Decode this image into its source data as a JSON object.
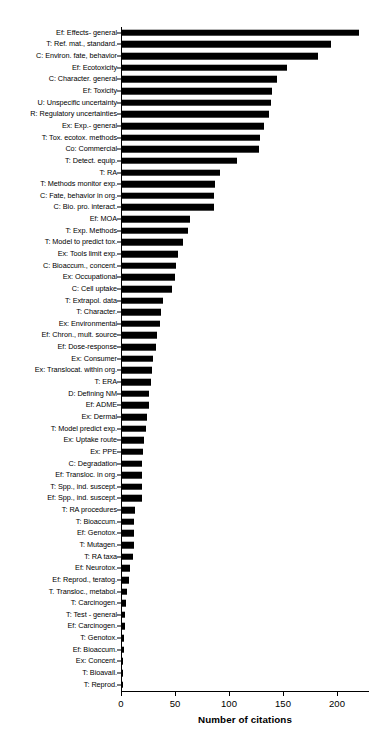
{
  "chart_data": {
    "type": "bar",
    "orientation": "horizontal",
    "title": "",
    "xlabel": "Number of citations",
    "ylabel": "",
    "xlim": [
      0,
      230
    ],
    "xticks": [
      0,
      50,
      100,
      150,
      200
    ],
    "xtick_labels": [
      "0",
      "50",
      "100",
      "150",
      "200"
    ],
    "grid": false,
    "legend": null,
    "bar_color": "#000000",
    "categories": [
      "Ef: Effects- general",
      "T: Ref. mat., standard.",
      "C: Environ. fate, behavior",
      "Ef: Ecotoxicity",
      "C: Character. general",
      "Ef: Toxicity",
      "U: Unspecific uncertainty",
      "R: Regulatory uncertainties",
      "Ex: Exp.- general",
      "T: Tox. ecotox. methods",
      "Co: Commercial",
      "T: Detect. equip.",
      "T: RA",
      "T: Methods monitor exp.",
      "C: Fate, behavior in org.",
      "C: Bio. pro. interact.",
      "Ef: MOA",
      "T: Exp. Methods",
      "T: Model to predict tox.",
      "Ex: Tools limit exp.",
      "C: Bioaccum., concent.",
      "Ex: Occupational",
      "C: Cell uptake",
      "T: Extrapol. data",
      "T: Character.",
      "Ex: Environmental",
      "Ef: Chron., mult. source",
      "Ef: Dose-response",
      "Ex: Consumer",
      "Ex: Translocat. within org.",
      "T: ERA",
      "D: Defining NM",
      "Ef: ADME",
      "Ex: Dermal",
      "T: Model predict exp.",
      "Ex: Uptake route",
      "Ex: PPE",
      "C: Degradation",
      "Ef: Transloc. in org.",
      "T: Spp., ind. suscept.",
      "Ef: Spp., ind. suscept.",
      "T: RA procedures",
      "T: Bioaccum.",
      "Ef: Genotox.",
      "T: Mutagen.",
      "T: RA taxa",
      "Ef: Neurotox.",
      "Ef: Reprod., teratog.",
      "T. Transloc., metabol.",
      "T: Carcinogen.",
      "T: Test - general",
      "Ef: Carcinogen.",
      "T: Genotox.",
      "Ef: Bioaccum.",
      "Ex: Concent.",
      "T: Bioavail.",
      "T: Reprod."
    ],
    "values": [
      220,
      194,
      182,
      154,
      144,
      140,
      139,
      137,
      132,
      129,
      128,
      107,
      92,
      87,
      86,
      86,
      64,
      62,
      57,
      53,
      51,
      50,
      47,
      39,
      37,
      36,
      33,
      32,
      30,
      29,
      28,
      26,
      26,
      24,
      23,
      21,
      20,
      19,
      19,
      19,
      19,
      13,
      12,
      12,
      12,
      11,
      8,
      7,
      6,
      5,
      4,
      4,
      3,
      3,
      2,
      2,
      1
    ]
  }
}
